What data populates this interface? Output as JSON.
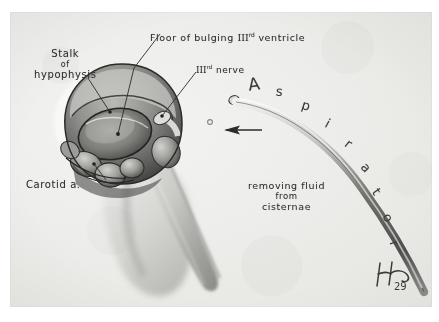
{
  "plate": {
    "medium": "pencil and wash medical illustration",
    "background_color": "#eeeeec",
    "ink_color": "#2e2e2e"
  },
  "labels": {
    "floor_of_ventricle": {
      "lines": [
        "Floor of bulging III",
        "rd",
        " ventricle"
      ],
      "text": "Floor of bulging IIIrd ventricle",
      "part1": "Floor of bulging ",
      "roman": "III",
      "ordinal": "rd",
      "part2": " ventricle"
    },
    "stalk_of_hypophysis": {
      "line1": "Stalk",
      "line2": "of",
      "line3": "hypophysis"
    },
    "third_nerve": {
      "roman": "III",
      "ordinal": "rd",
      "rest": " nerve",
      "text": "IIIrd nerve"
    },
    "carotid_artery": {
      "text": "Carotid a."
    },
    "removing_fluid": {
      "line1": "removing fluid",
      "line2": "from",
      "line3": "cisternae"
    },
    "aspirator": {
      "text": "Aspirator",
      "letters": [
        "A",
        "s",
        "p",
        "i",
        "r",
        "a",
        "t",
        "o",
        "r"
      ]
    }
  },
  "signature": {
    "initial": "H",
    "year": "29"
  },
  "annotations": {
    "flow_arrow": "arrow pointing left toward surgical field, indicating fluid aspiration direction"
  }
}
